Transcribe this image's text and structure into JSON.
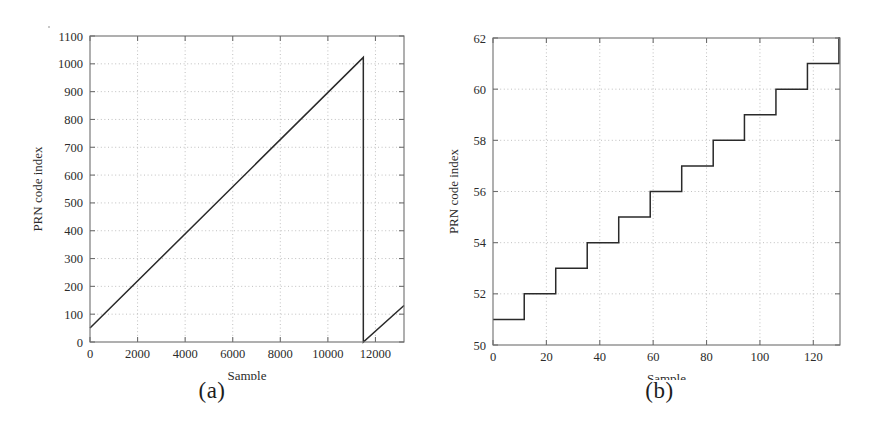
{
  "figure": {
    "background": "#ffffff",
    "line_color": "#2a2a2a",
    "axis_color": "#6e6e6e",
    "grid_color": "#b9b9b9"
  },
  "panels": [
    {
      "id": "a",
      "caption": "(a)",
      "chart_data": {
        "type": "line",
        "title": "",
        "xlabel": "Sample",
        "ylabel": "PRN code index",
        "xlim": [
          0,
          13200
        ],
        "ylim": [
          0,
          1100
        ],
        "xticks": [
          0,
          2000,
          4000,
          6000,
          8000,
          10000,
          12000
        ],
        "xticklabels": [
          "0",
          "2000",
          "4000",
          "6000",
          "8000",
          "10000",
          "12000"
        ],
        "yticks": [
          0,
          100,
          200,
          300,
          400,
          500,
          600,
          700,
          800,
          900,
          1000,
          1100
        ],
        "yticklabels": [
          "0",
          "100",
          "200",
          "300",
          "400",
          "500",
          "600",
          "700",
          "800",
          "900",
          "1000",
          "1100"
        ],
        "grid": true,
        "legend": false,
        "series": [
          {
            "name": "PRN code index sawtooth",
            "x": [
              0,
              11490,
              11490,
              13200
            ],
            "y": [
              50,
              1023,
              0,
              131
            ]
          }
        ],
        "annotations": []
      }
    },
    {
      "id": "b",
      "caption": "(b)",
      "chart_data": {
        "type": "line",
        "title": "",
        "xlabel": "Sample",
        "ylabel": "PRN code index",
        "xlim": [
          0,
          130
        ],
        "ylim": [
          50,
          62
        ],
        "xticks": [
          0,
          20,
          40,
          60,
          80,
          100,
          120
        ],
        "xticklabels": [
          "0",
          "20",
          "40",
          "60",
          "80",
          "100",
          "120"
        ],
        "yticks": [
          50,
          52,
          54,
          56,
          58,
          60,
          62
        ],
        "yticklabels": [
          "50",
          "52",
          "54",
          "56",
          "58",
          "60",
          "62"
        ],
        "grid": true,
        "legend": false,
        "series": [
          {
            "name": "PRN code index staircase",
            "step_edges": [
              0,
              11.7,
              23.5,
              35.3,
              47.1,
              58.9,
              70.7,
              82.5,
              94.2,
              106.0,
              117.8,
              129.6
            ],
            "step_values": [
              51,
              52,
              53,
              54,
              55,
              56,
              57,
              58,
              59,
              60,
              61,
              62
            ],
            "x": [
              0,
              11.7,
              11.7,
              23.5,
              23.5,
              35.3,
              35.3,
              47.1,
              47.1,
              58.9,
              58.9,
              70.7,
              70.7,
              82.5,
              82.5,
              94.2,
              94.2,
              106.0,
              106.0,
              117.8,
              117.8,
              129.6,
              129.6,
              130
            ],
            "y": [
              51,
              51,
              52,
              52,
              53,
              53,
              54,
              54,
              55,
              55,
              56,
              56,
              57,
              57,
              58,
              58,
              59,
              59,
              60,
              60,
              61,
              61,
              62,
              62
            ]
          }
        ],
        "annotations": []
      }
    }
  ]
}
